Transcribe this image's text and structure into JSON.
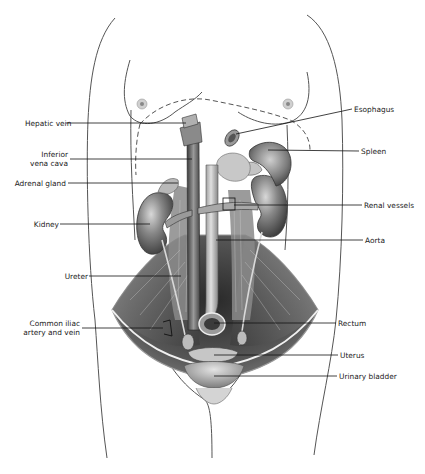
{
  "figure": {
    "labels_left": [
      {
        "id": "hepatic-vein",
        "text": "Hepatic vein",
        "x": 25,
        "y": 119,
        "line": [
          66,
          123,
          186,
          123
        ]
      },
      {
        "id": "inferior-vena-cava",
        "text": "Inferior\nvena cava",
        "lines": [
          "Inferior",
          "vena cava"
        ],
        "x": 38,
        "y": 150,
        "line": [
          70,
          159,
          190,
          159
        ]
      },
      {
        "id": "adrenal-gland",
        "text": "Adrenal gland",
        "x": 13,
        "y": 179,
        "line": [
          68,
          183,
          178,
          183
        ]
      },
      {
        "id": "kidney",
        "text": "Kidney",
        "x": 35,
        "y": 220,
        "line": [
          60,
          224,
          148,
          224
        ]
      },
      {
        "id": "ureter",
        "text": "Ureter",
        "x": 62,
        "y": 272,
        "line": [
          89,
          276,
          181,
          276
        ]
      },
      {
        "id": "common-iliac",
        "text": "Common iliac\nartery and vein",
        "lines": [
          "Common iliac",
          "artery and vein"
        ],
        "x": 24,
        "y": 318,
        "line": [
          82,
          328,
          163,
          328
        ]
      }
    ],
    "labels_right": [
      {
        "id": "esophagus",
        "text": "Esophagus",
        "x": 354,
        "y": 105,
        "line": [
          352,
          109,
          236,
          134
        ]
      },
      {
        "id": "spleen",
        "text": "Spleen",
        "x": 361,
        "y": 147,
        "line": [
          359,
          151,
          266,
          150
        ]
      },
      {
        "id": "renal-vessels",
        "text": "Renal vessels",
        "x": 364,
        "y": 201,
        "line": [
          362,
          205,
          232,
          205
        ]
      },
      {
        "id": "aorta",
        "text": "Aorta",
        "x": 365,
        "y": 236,
        "line": [
          363,
          240,
          217,
          240
        ]
      },
      {
        "id": "rectum",
        "text": "Rectum",
        "x": 338,
        "y": 319,
        "line": [
          336,
          323,
          212,
          323
        ]
      },
      {
        "id": "uterus",
        "text": "Uterus",
        "x": 340,
        "y": 351,
        "line": [
          338,
          355,
          212,
          355
        ]
      },
      {
        "id": "urinary-bladder",
        "text": "Urinary bladder",
        "x": 339,
        "y": 372,
        "line": [
          337,
          376,
          212,
          376
        ]
      }
    ]
  },
  "colors": {
    "background": "#ffffff",
    "outline": "#555555",
    "label_text": "#1a1a1a",
    "leader_line": "#111111",
    "organ_dark": "#4a4a4a",
    "organ_mid": "#7d7d7d",
    "organ_light": "#b8b8b8",
    "muscle": "#6e6e6e"
  }
}
